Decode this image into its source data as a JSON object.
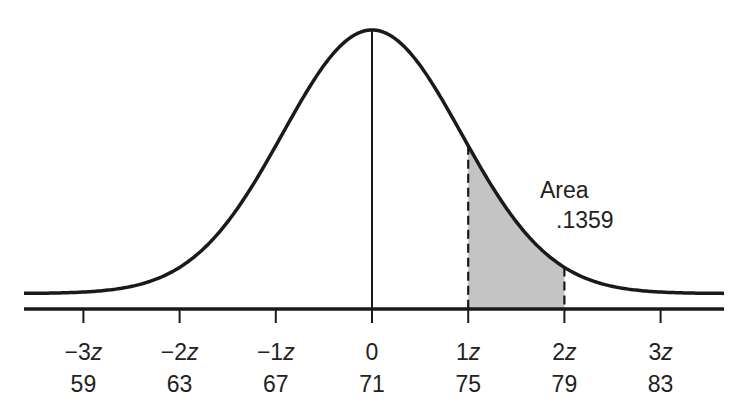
{
  "chart_data": {
    "type": "area",
    "title": "",
    "subtitle": "",
    "xlabel": "",
    "ylabel": "",
    "distribution": {
      "mean": 71,
      "sd": 4
    },
    "z_ticks": [
      "−3z",
      "−2z",
      "−1z",
      "0",
      "1z",
      "2z",
      "3z"
    ],
    "value_ticks": [
      "59",
      "63",
      "67",
      "71",
      "75",
      "79",
      "83"
    ],
    "x_z_values": [
      -3,
      -2,
      -1,
      0,
      1,
      2,
      3
    ],
    "x_values": [
      59,
      63,
      67,
      71,
      75,
      79,
      83
    ],
    "shaded_region": {
      "from_z": 1,
      "to_z": 2,
      "from_value": 75,
      "to_value": 79,
      "area": 0.1359
    },
    "annotations": [
      {
        "text": "Area",
        "anchor": "above-right of shaded region"
      },
      {
        "text": ".1359",
        "anchor": "below 'Area'"
      }
    ],
    "mean_line": {
      "z": 0,
      "value": 71,
      "style": "solid"
    },
    "boundary_lines": [
      {
        "z": 1,
        "style": "dashed"
      },
      {
        "z": 2,
        "style": "dashed"
      }
    ],
    "grid": false,
    "legend": null,
    "colors": {
      "curve": "#1a1a1a",
      "shade": "#c4c4c4",
      "axis": "#1a1a1a",
      "background": "#ffffff"
    }
  },
  "annotation": {
    "area_label": "Area",
    "area_value": ".1359"
  },
  "axis": {
    "z_labels": [
      "−3z",
      "−2z",
      "−1z",
      "0",
      "1z",
      "2z",
      "3z"
    ],
    "value_labels": [
      "59",
      "63",
      "67",
      "71",
      "75",
      "79",
      "83"
    ]
  }
}
